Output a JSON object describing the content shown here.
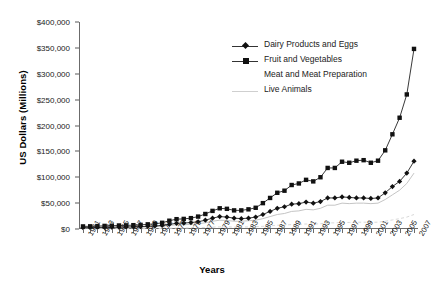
{
  "chart_data": {
    "type": "line",
    "title": "",
    "xlabel": "Years",
    "ylabel": "US Dollars (Millions)",
    "ylim": [
      0,
      400000
    ],
    "ytick_labels": [
      "$0",
      "$50,000",
      "$100,000",
      "$150,000",
      "$200,000",
      "$250,000",
      "$300,000",
      "$350,000",
      "$400,000"
    ],
    "ytick_values": [
      0,
      50000,
      100000,
      150000,
      200000,
      250000,
      300000,
      350000,
      400000
    ],
    "grid": false,
    "legend_position": "top-right",
    "x": [
      1961,
      1962,
      1963,
      1964,
      1965,
      1966,
      1967,
      1968,
      1969,
      1970,
      1971,
      1972,
      1973,
      1974,
      1975,
      1976,
      1977,
      1978,
      1979,
      1980,
      1981,
      1982,
      1983,
      1984,
      1985,
      1986,
      1987,
      1988,
      1989,
      1990,
      1991,
      1992,
      1993,
      1994,
      1995,
      1996,
      1997,
      1998,
      1999,
      2000,
      2001,
      2002,
      2003,
      2004,
      2005,
      2006,
      2007
    ],
    "xtick_labels": [
      "1961",
      "1963",
      "1965",
      "1967",
      "1969",
      "1971",
      "1973",
      "1975",
      "1977",
      "1979",
      "1981",
      "1983",
      "1985",
      "1987",
      "1989",
      "1991",
      "1993",
      "1995",
      "1997",
      "1999",
      "2001",
      "2003",
      "2005",
      "2007"
    ],
    "series": [
      {
        "name": "Dairy Products and Eggs",
        "marker": "diamond",
        "color": "#222222",
        "values": [
          2500,
          2700,
          2900,
          3100,
          3400,
          3700,
          3900,
          4200,
          4600,
          5200,
          5800,
          7000,
          9000,
          11000,
          11500,
          12500,
          14000,
          17000,
          21000,
          24000,
          23000,
          21000,
          20000,
          21000,
          23000,
          28000,
          34000,
          40000,
          43000,
          48000,
          49000,
          52000,
          50000,
          53000,
          60000,
          60000,
          62000,
          61000,
          60000,
          60000,
          59000,
          60000,
          70000,
          82000,
          92000,
          108000,
          131000
        ]
      },
      {
        "name": "Fruit and Vegetables",
        "marker": "square",
        "color": "#222222",
        "values": [
          5000,
          5200,
          5600,
          6000,
          6300,
          6800,
          7000,
          7400,
          8000,
          9000,
          10000,
          12000,
          16000,
          19000,
          19500,
          21000,
          24000,
          29000,
          35000,
          40000,
          39000,
          36000,
          36000,
          38000,
          41000,
          50000,
          60000,
          70000,
          74000,
          85000,
          88000,
          95000,
          92000,
          100000,
          118000,
          118000,
          130000,
          128000,
          132000,
          133000,
          128000,
          132000,
          152000,
          183000,
          215000,
          260000,
          348000
        ]
      },
      {
        "name": "Meat and Meat Preparation",
        "marker": "none",
        "color": "#bdbdbd",
        "values": [
          2000,
          2100,
          2300,
          2500,
          2700,
          2900,
          3000,
          3200,
          3500,
          4000,
          4500,
          5500,
          7000,
          8000,
          8200,
          9000,
          10000,
          12000,
          15000,
          17000,
          16500,
          15000,
          15000,
          16000,
          17000,
          20000,
          24000,
          28000,
          30000,
          34000,
          35000,
          38000,
          37000,
          40000,
          46000,
          46000,
          50000,
          49000,
          50000,
          50000,
          49000,
          50000,
          57000,
          66000,
          75000,
          88000,
          108000
        ]
      },
      {
        "name": "Live Animals",
        "marker": "none",
        "color": "#d9d9d9",
        "dash": true,
        "values": [
          400,
          420,
          450,
          480,
          520,
          560,
          600,
          650,
          700,
          800,
          900,
          1100,
          1500,
          1800,
          1900,
          2100,
          2400,
          2900,
          3600,
          4200,
          4100,
          3800,
          3800,
          4000,
          4400,
          5200,
          6200,
          7200,
          7600,
          8600,
          9000,
          9600,
          9400,
          10200,
          11800,
          11800,
          12800,
          12600,
          13000,
          13200,
          12800,
          13200,
          15000,
          17500,
          20000,
          23000,
          28000
        ]
      }
    ]
  },
  "legend": {
    "items": [
      {
        "label": "Dairy Products and Eggs",
        "marker": "diamond"
      },
      {
        "label": "Fruit and Vegetables",
        "marker": "square"
      },
      {
        "label": "Meat and Meat Preparation",
        "marker": "none"
      },
      {
        "label": "Live Animals",
        "marker": "faint-line"
      }
    ]
  },
  "caption_cut": ""
}
